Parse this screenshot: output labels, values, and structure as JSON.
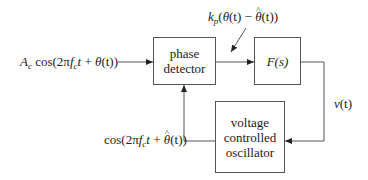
{
  "diagram": {
    "blocks": {
      "phase_detector": {
        "line1": "phase",
        "line2": "detector"
      },
      "loop_filter": {
        "label": "F(s)"
      },
      "vco": {
        "line1": "voltage",
        "line2": "controlled",
        "line3": "oscillator"
      }
    },
    "signals": {
      "input": {
        "amp": "A",
        "amp_sub": "c",
        "fn": " cos(2π",
        "f": "f",
        "f_sub": "c",
        "t": "t",
        "plus": " + ",
        "theta": "θ",
        "rest": "(t))"
      },
      "pd_output": {
        "k": "k",
        "k_sub": "p",
        "open": "(",
        "theta": "θ",
        "t1": "(t) − ",
        "theta_hat": "θ",
        "t2": "(t))"
      },
      "control": {
        "v": "v",
        "rest": "(t)"
      },
      "vco_output": {
        "fn": "cos(2π",
        "f": "f",
        "f_sub": "c",
        "t": "t",
        "plus": " + ",
        "theta_hat": "θ",
        "rest": "(t))"
      }
    },
    "colors": {
      "line": "#555555",
      "text": "#222222"
    }
  }
}
